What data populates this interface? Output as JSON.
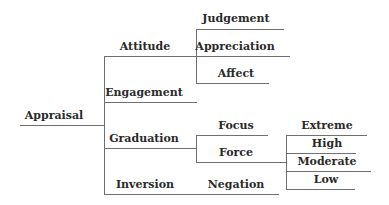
{
  "diagram": {
    "title": "Appraisal",
    "root": {
      "label": "Appraisal",
      "children": [
        {
          "label": "Attitude",
          "children": [
            {
              "label": "Judgement"
            },
            {
              "label": "Appreciation"
            },
            {
              "label": "Affect"
            }
          ]
        },
        {
          "label": "Engagement"
        },
        {
          "label": "Graduation",
          "children": [
            {
              "label": "Focus"
            },
            {
              "label": "Force",
              "children": [
                {
                  "label": "Extreme"
                },
                {
                  "label": "High"
                },
                {
                  "label": "Moderate"
                },
                {
                  "label": "Low"
                }
              ]
            }
          ]
        },
        {
          "label": "Inversion",
          "children": [
            {
              "label": "Negation"
            }
          ]
        }
      ]
    },
    "line_color": "#6f6f6f",
    "text_color": "#2a2a2a"
  }
}
